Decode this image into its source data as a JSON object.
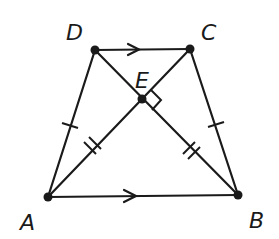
{
  "diagram": {
    "type": "isosceles-trapezoid",
    "points": {
      "A": {
        "label": "A",
        "x": 48,
        "y": 197
      },
      "B": {
        "label": "B",
        "x": 238,
        "y": 195
      },
      "C": {
        "label": "C",
        "x": 190,
        "y": 49
      },
      "D": {
        "label": "D",
        "x": 95,
        "y": 50
      },
      "E": {
        "label": "E",
        "x": 142,
        "y": 99
      }
    },
    "segments": [
      "AB",
      "BC",
      "CD",
      "DA",
      "AC",
      "BD"
    ],
    "parallel_marks": [
      "DC",
      "AB"
    ],
    "congruent_single_tick": [
      "AD",
      "BC"
    ],
    "congruent_double_tick": [
      "AE",
      "BE"
    ],
    "right_angle_at": "E"
  }
}
